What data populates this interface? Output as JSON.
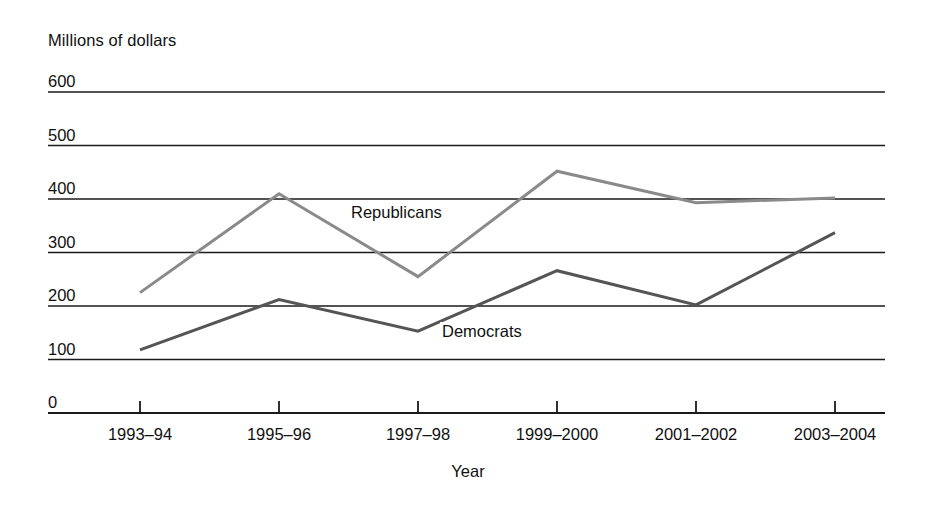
{
  "chart_data": {
    "type": "line",
    "title": "",
    "ylabel": "Millions of dollars",
    "xlabel": "Year",
    "categories": [
      "1993–94",
      "1995–96",
      "1997–98",
      "1999–2000",
      "2001–2002",
      "2003–2004"
    ],
    "yticks": [
      0,
      100,
      200,
      300,
      400,
      500,
      600
    ],
    "ylim": [
      0,
      600
    ],
    "grid": true,
    "legend_position": "inline-annotations",
    "series": [
      {
        "name": "Republicans",
        "color": "#8a8a8a",
        "values": [
          225,
          410,
          255,
          452,
          393,
          402
        ]
      },
      {
        "name": "Democrats",
        "color": "#555555",
        "values": [
          118,
          212,
          153,
          266,
          202,
          337
        ]
      }
    ]
  },
  "axes": {
    "y_title": "Millions of dollars",
    "x_title": "Year",
    "y_tick_labels": [
      "600",
      "500",
      "400",
      "300",
      "200",
      "100",
      "0"
    ],
    "x_tick_labels": [
      "1993–94",
      "1995–96",
      "1997–98",
      "1999–2000",
      "2001–2002",
      "2003–2004"
    ]
  },
  "annotations": {
    "republicans": "Republicans",
    "democrats": "Democrats"
  },
  "colors": {
    "republicans_line": "#8a8a8a",
    "democrats_line": "#555555",
    "gridline": "#1a1a1a",
    "text": "#111111",
    "background": "#ffffff"
  }
}
